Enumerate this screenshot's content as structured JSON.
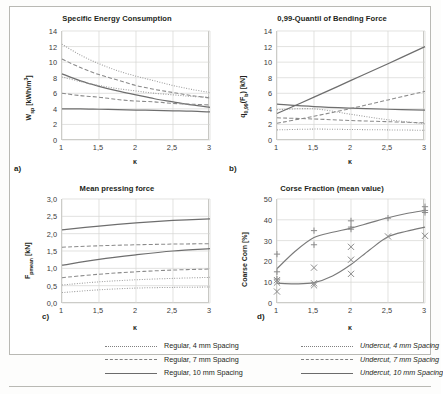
{
  "figure": {
    "xlabel": "κ",
    "xticks": [
      "1",
      "1,5",
      "2",
      "2,5",
      "3"
    ],
    "xlim": [
      1,
      3
    ]
  },
  "legend": {
    "items": [
      {
        "label": "Regular, 4 mm Spacing",
        "style": "dotted",
        "column": "left"
      },
      {
        "label": "Regular, 7 mm Spacing",
        "style": "dashed",
        "column": "left"
      },
      {
        "label": "Regular, 10 mm Spacing",
        "style": "solid",
        "column": "left"
      },
      {
        "label": "Undercut, 4 mm Spacing",
        "style": "dotted",
        "column": "right"
      },
      {
        "label": "Undercut, 7 mm Spacing",
        "style": "dashed",
        "column": "right"
      },
      {
        "label": "Undercut, 10 mm Spacing",
        "style": "solid",
        "column": "right"
      }
    ]
  },
  "panels": [
    {
      "tag": "a)",
      "title": "Specific Energy Consumption"
    },
    {
      "tag": "b)",
      "title": "0,99-Quantil of Bending Force"
    },
    {
      "tag": "c)",
      "title": "Mean pressing force"
    },
    {
      "tag": "d)",
      "title": "Corse Fraction (mean value)"
    }
  ],
  "chart_data": [
    {
      "panel": "a",
      "type": "line",
      "title": "Specific Energy Consumption",
      "xlabel": "κ",
      "ylabel": "W_sp [kWh/m³]",
      "ylabel_html": "W<sub>sp</sub> [kWh/m<sup>3</sup>]",
      "xlim": [
        1,
        3
      ],
      "ylim": [
        0,
        14
      ],
      "yticks": [
        0,
        2,
        4,
        6,
        8,
        10,
        12,
        14
      ],
      "ytick_labels": [
        "0",
        "2",
        "4",
        "6",
        "8",
        "10",
        "12",
        "14"
      ],
      "xticks": [
        1,
        1.5,
        2,
        2.5,
        3
      ],
      "xtick_labels": [
        "1",
        "1,5",
        "2",
        "2,5",
        "3"
      ],
      "grid": true,
      "x": [
        1,
        1.25,
        1.5,
        1.75,
        2,
        2.25,
        2.5,
        2.75,
        3
      ],
      "series": [
        {
          "name": "Regular, 4 mm Spacing",
          "style": "dotted",
          "values": [
            12.3,
            10.9,
            9.8,
            8.9,
            8.2,
            7.6,
            7.0,
            6.5,
            6.1
          ]
        },
        {
          "name": "Regular, 7 mm Spacing",
          "style": "dashed",
          "values": [
            10.4,
            9.3,
            8.4,
            7.7,
            7.0,
            6.5,
            6.1,
            5.7,
            5.4
          ]
        },
        {
          "name": "Regular, 10 mm Spacing",
          "style": "solid",
          "values": [
            8.5,
            7.6,
            6.9,
            6.3,
            5.8,
            5.3,
            4.9,
            4.5,
            4.2
          ]
        },
        {
          "name": "Undercut, 4 mm Spacing",
          "style": "dotted",
          "values": [
            8.1,
            7.5,
            7.0,
            6.6,
            6.3,
            6.0,
            5.8,
            5.6,
            5.5
          ]
        },
        {
          "name": "Undercut, 7 mm Spacing",
          "style": "dashed",
          "values": [
            6.0,
            5.7,
            5.5,
            5.2,
            5.0,
            4.9,
            4.7,
            4.6,
            4.5
          ]
        },
        {
          "name": "Undercut, 10 mm Spacing",
          "style": "solid",
          "values": [
            4.0,
            4.0,
            3.95,
            3.9,
            3.85,
            3.8,
            3.75,
            3.7,
            3.6
          ]
        }
      ]
    },
    {
      "panel": "b",
      "type": "line",
      "title": "0,99-Quantil of Bending Force",
      "xlabel": "κ",
      "ylabel": "q_0,99(F_b) [kN]",
      "ylabel_html": "q<sub>0,99</sub>(F<sub>b</sub>) [kN]",
      "xlim": [
        1,
        3
      ],
      "ylim": [
        0,
        14
      ],
      "yticks": [
        0,
        2,
        4,
        6,
        8,
        10,
        12,
        14
      ],
      "ytick_labels": [
        "0",
        "2",
        "4",
        "6",
        "8",
        "10",
        "12",
        "14"
      ],
      "xticks": [
        1,
        1.5,
        2,
        2.5,
        3
      ],
      "xtick_labels": [
        "1",
        "1,5",
        "2",
        "2,5",
        "3"
      ],
      "grid": true,
      "x": [
        1,
        1.5,
        2,
        2.5,
        3
      ],
      "series": [
        {
          "name": "Regular, 4 mm Spacing",
          "style": "dotted",
          "values": [
            1.3,
            1.4,
            1.35,
            1.3,
            1.25
          ]
        },
        {
          "name": "Regular, 7 mm Spacing",
          "style": "dashed",
          "values": [
            2.85,
            2.7,
            2.5,
            2.35,
            2.2
          ]
        },
        {
          "name": "Regular, 10 mm Spacing",
          "style": "solid",
          "values": [
            4.6,
            4.3,
            4.1,
            3.95,
            3.85
          ]
        },
        {
          "name": "Undercut, 4 mm Spacing",
          "style": "dotted",
          "values": [
            3.9,
            4.0,
            3.3,
            2.6,
            2.1
          ]
        },
        {
          "name": "Undercut, 7 mm Spacing",
          "style": "dashed",
          "values": [
            2.15,
            3.05,
            4.05,
            5.15,
            6.25
          ]
        },
        {
          "name": "Undercut, 10 mm Spacing",
          "style": "solid",
          "values": [
            3.4,
            5.5,
            7.65,
            9.8,
            12.0
          ]
        }
      ]
    },
    {
      "panel": "c",
      "type": "line",
      "title": "Mean pressing force",
      "xlabel": "κ",
      "ylabel": "F_pmean [kN]",
      "ylabel_html": "F<sub>pmean</sub> [kN]",
      "xlim": [
        1,
        3
      ],
      "ylim": [
        0,
        3
      ],
      "yticks": [
        0,
        0.5,
        1,
        1.5,
        2,
        2.5,
        3
      ],
      "ytick_labels": [
        "0,0",
        "0,5",
        "1,0",
        "1,5",
        "2,0",
        "2,5",
        "3,0"
      ],
      "xticks": [
        1,
        1.5,
        2,
        2.5,
        3
      ],
      "xtick_labels": [
        "1",
        "1,5",
        "2",
        "2,5",
        "3"
      ],
      "grid": true,
      "x": [
        1,
        1.5,
        2,
        2.5,
        3
      ],
      "series": [
        {
          "name": "Regular, 4 mm Spacing",
          "style": "dotted",
          "values": [
            0.3,
            0.38,
            0.43,
            0.45,
            0.46
          ]
        },
        {
          "name": "Regular, 7 mm Spacing",
          "style": "dashed",
          "values": [
            0.73,
            0.83,
            0.9,
            0.95,
            0.98
          ]
        },
        {
          "name": "Regular, 10 mm Spacing",
          "style": "solid",
          "values": [
            1.09,
            1.26,
            1.39,
            1.5,
            1.57
          ]
        },
        {
          "name": "Undercut, 4 mm Spacing",
          "style": "dotted",
          "values": [
            0.52,
            0.61,
            0.67,
            0.71,
            0.74
          ]
        },
        {
          "name": "Undercut, 7 mm Spacing",
          "style": "dashed",
          "values": [
            1.61,
            1.65,
            1.68,
            1.7,
            1.71
          ]
        },
        {
          "name": "Undercut, 10 mm Spacing",
          "style": "solid",
          "values": [
            2.11,
            2.22,
            2.31,
            2.38,
            2.43
          ]
        }
      ]
    },
    {
      "panel": "d",
      "type": "scatter",
      "title": "Corse Fraction (mean value)",
      "xlabel": "κ",
      "ylabel": "Coarse Corn [%]",
      "ylabel_html": "Coarse Corn [%]",
      "xlim": [
        1,
        3
      ],
      "ylim": [
        0,
        50
      ],
      "yticks": [
        0,
        10,
        20,
        30,
        40,
        50
      ],
      "ytick_labels": [
        "0",
        "10",
        "20",
        "30",
        "40",
        "50"
      ],
      "xticks": [
        1,
        1.5,
        2,
        2.5,
        3
      ],
      "xtick_labels": [
        "1",
        "1,5",
        "2",
        "2,5",
        "3"
      ],
      "grid": true,
      "trend_x": [
        1,
        1.25,
        1.5,
        1.75,
        2,
        2.25,
        2.5,
        2.75,
        3
      ],
      "series": [
        {
          "name": "Undercut trend (plus markers)",
          "style": "solid",
          "marker": "plus",
          "trend": [
            16.5,
            25.0,
            31.5,
            34.0,
            36.0,
            38.5,
            41.0,
            43.0,
            44.5
          ],
          "points": [
            {
              "x": 1,
              "y": 23.5
            },
            {
              "x": 1,
              "y": 15.0
            },
            {
              "x": 1,
              "y": 11.5
            },
            {
              "x": 1.5,
              "y": 34.8
            },
            {
              "x": 1.5,
              "y": 28.0
            },
            {
              "x": 2,
              "y": 39.5
            },
            {
              "x": 2,
              "y": 36.5
            },
            {
              "x": 2,
              "y": 35.5
            },
            {
              "x": 2.5,
              "y": 40.8
            },
            {
              "x": 3,
              "y": 46.3
            },
            {
              "x": 3,
              "y": 44.5
            },
            {
              "x": 3,
              "y": 43.5
            }
          ]
        },
        {
          "name": "Regular trend (cross markers)",
          "style": "solid",
          "marker": "cross",
          "trend": [
            9.5,
            9.2,
            9.8,
            13.0,
            18.5,
            25.5,
            31.8,
            34.5,
            36.5
          ],
          "points": [
            {
              "x": 1,
              "y": 11.0
            },
            {
              "x": 1,
              "y": 9.8
            },
            {
              "x": 1,
              "y": 5.5
            },
            {
              "x": 1.5,
              "y": 17.0
            },
            {
              "x": 1.5,
              "y": 9.5
            },
            {
              "x": 1.5,
              "y": 8.5
            },
            {
              "x": 2,
              "y": 27.0
            },
            {
              "x": 2,
              "y": 20.8
            },
            {
              "x": 2,
              "y": 14.0
            },
            {
              "x": 2.5,
              "y": 32.0
            },
            {
              "x": 3,
              "y": 32.3
            }
          ]
        }
      ]
    }
  ]
}
